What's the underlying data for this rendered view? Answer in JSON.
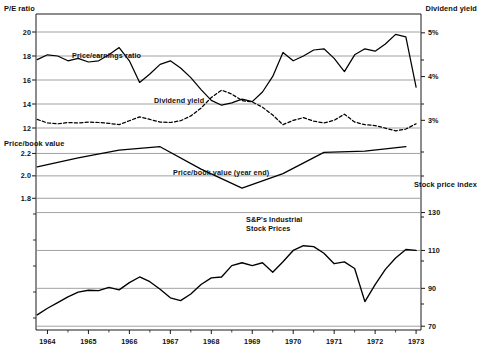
{
  "figure": {
    "left_axis_title": "P/E ratio",
    "right_axis_title": "Dividend yield",
    "right_axis_title_2": "Stock price index",
    "middle_axis_title": "Price/book value"
  },
  "annotations": {
    "pe": "Price/earnings ratio",
    "dy": "Dividend yield",
    "pb": "Price/book value (year end)",
    "sp_line1": "S&P's Industrial",
    "sp_line2": "Stock Prices"
  },
  "axes": {
    "x_ticks": [
      "1964",
      "1965",
      "1966",
      "1967",
      "1968",
      "1969",
      "1970",
      "1971",
      "1972",
      "1973"
    ],
    "panel1_left_ticks": [
      "20",
      "18",
      "16",
      "14",
      "12"
    ],
    "panel1_right_ticks": [
      "5%",
      "4%",
      "3%"
    ],
    "panel2_left_ticks": [
      "2.2",
      "2.0",
      "1.8"
    ],
    "panel3_right_ticks": [
      "130",
      "110",
      "90",
      "70"
    ]
  },
  "chart_data": {
    "type": "line",
    "title": "",
    "xlabel": "",
    "ylabel": "",
    "grid": true,
    "legend": "inline-annotations",
    "panels": [
      {
        "name": "panel-pe-dividend",
        "ylabel": "P/E ratio",
        "ylabel_right": "Dividend yield",
        "ylim": [
          11.0,
          21.5
        ],
        "yticks": [
          20,
          18,
          16,
          14,
          12
        ],
        "ylim_right": [
          2.55,
          5.43
        ],
        "yticks_right": [
          5,
          4,
          3
        ],
        "series": [
          {
            "name": "Price/earnings ratio",
            "style": "solid",
            "x": [
              1963.75,
              1964.0,
              1964.25,
              1964.5,
              1964.75,
              1965.0,
              1965.25,
              1965.5,
              1965.75,
              1966.0,
              1966.25,
              1966.5,
              1966.75,
              1967.0,
              1967.25,
              1967.5,
              1967.75,
              1968.0,
              1968.25,
              1968.5,
              1968.75,
              1969.0,
              1969.25,
              1969.5,
              1969.75,
              1970.0,
              1970.25,
              1970.5,
              1970.75,
              1971.0,
              1971.25,
              1971.5,
              1971.75,
              1972.0,
              1972.25,
              1972.5,
              1972.75,
              1973.0
            ],
            "y": [
              17.7,
              18.1,
              18.0,
              17.6,
              17.8,
              17.5,
              17.6,
              18.1,
              18.7,
              17.6,
              15.8,
              16.5,
              17.3,
              17.6,
              17.0,
              16.2,
              15.2,
              14.3,
              13.9,
              14.1,
              14.4,
              14.2,
              15.0,
              16.3,
              18.3,
              17.6,
              18.0,
              18.5,
              18.6,
              17.8,
              16.7,
              18.1,
              18.6,
              18.4,
              19.0,
              19.8,
              19.6,
              15.4
            ]
          },
          {
            "name": "Dividend yield",
            "style": "dashed",
            "x": [
              1963.75,
              1964.0,
              1964.25,
              1964.5,
              1964.75,
              1965.0,
              1965.25,
              1965.5,
              1965.75,
              1966.0,
              1966.25,
              1966.5,
              1966.75,
              1967.0,
              1967.25,
              1967.5,
              1967.75,
              1968.0,
              1968.25,
              1968.5,
              1968.75,
              1969.0,
              1969.25,
              1969.5,
              1969.75,
              1970.0,
              1970.25,
              1970.5,
              1970.75,
              1971.0,
              1971.25,
              1971.5,
              1971.75,
              1972.0,
              1972.25,
              1972.5,
              1972.75,
              1973.0
            ],
            "y_right": [
              3.02,
              2.94,
              2.92,
              2.95,
              2.94,
              2.96,
              2.95,
              2.93,
              2.9,
              2.99,
              3.08,
              3.02,
              2.96,
              2.95,
              2.99,
              3.1,
              3.28,
              3.52,
              3.69,
              3.6,
              3.45,
              3.42,
              3.3,
              3.12,
              2.9,
              3.0,
              3.06,
              2.98,
              2.94,
              3.0,
              3.14,
              2.96,
              2.9,
              2.88,
              2.82,
              2.76,
              2.8,
              2.92
            ]
          }
        ]
      },
      {
        "name": "panel-price-book",
        "ylabel": "Price/book value",
        "ylim": [
          1.74,
          2.32
        ],
        "yticks": [
          2.2,
          2.0,
          1.8
        ],
        "series": [
          {
            "name": "Price/book value (year end)",
            "style": "solid",
            "x": [
              1963.75,
              1964.75,
              1965.75,
              1966.75,
              1967.75,
              1968.75,
              1969.75,
              1970.75,
              1971.75,
              1972.75
            ],
            "y": [
              2.08,
              2.16,
              2.23,
              2.26,
              2.06,
              1.89,
              2.02,
              2.21,
              2.22,
              2.26
            ]
          }
        ]
      },
      {
        "name": "panel-stock-price-index",
        "ylabel_right": "Stock price index",
        "ylim": [
          68,
          134
        ],
        "yticks": [
          130,
          110,
          90,
          70
        ],
        "series": [
          {
            "name": "S&P's Industrial Stock Prices",
            "style": "solid",
            "x": [
              1963.75,
              1964.0,
              1964.25,
              1964.5,
              1964.75,
              1965.0,
              1965.25,
              1965.5,
              1965.75,
              1966.0,
              1966.25,
              1966.5,
              1966.75,
              1967.0,
              1967.25,
              1967.5,
              1967.75,
              1968.0,
              1968.25,
              1968.5,
              1968.75,
              1969.0,
              1969.25,
              1969.5,
              1969.75,
              1970.0,
              1970.25,
              1970.5,
              1970.75,
              1971.0,
              1971.25,
              1971.5,
              1971.75,
              1972.0,
              1972.25,
              1972.5,
              1972.75,
              1973.0
            ],
            "y": [
              76.0,
              79.5,
              82.5,
              85.5,
              88.0,
              89.0,
              88.8,
              90.5,
              89.2,
              93.0,
              96.0,
              93.5,
              89.5,
              85.0,
              83.5,
              87.0,
              92.0,
              95.5,
              96.0,
              102.0,
              103.5,
              102.0,
              103.5,
              98.5,
              104.0,
              110.0,
              112.5,
              112.0,
              108.5,
              103.0,
              104.0,
              100.5,
              83.0,
              92.0,
              100.0,
              106.0,
              110.5,
              110.0
            ]
          }
        ]
      }
    ]
  },
  "colors": {
    "line": "#000000",
    "grid": "#8a8a8a",
    "axis": "#1a1a1a",
    "background": "#ffffff"
  }
}
